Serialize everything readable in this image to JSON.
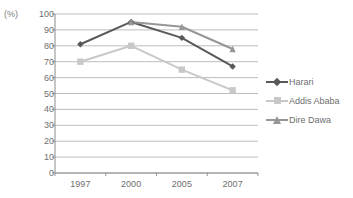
{
  "chart_data": {
    "type": "line",
    "title": "",
    "xlabel": "",
    "ylabel": "(%)",
    "categories": [
      "1997",
      "2000",
      "2005",
      "2007"
    ],
    "ylim": [
      0,
      100
    ],
    "ytick_step": 10,
    "yticks": [
      100,
      90,
      80,
      70,
      60,
      50,
      40,
      30,
      20,
      10,
      0
    ],
    "grid": "horizontal",
    "legend_position": "right",
    "series": [
      {
        "name": "Harari",
        "values": [
          81,
          95,
          85,
          67
        ],
        "color": "#595959",
        "marker": "diamond"
      },
      {
        "name": "Addis Ababa",
        "values": [
          70,
          80,
          65,
          52
        ],
        "color": "#c8c8c8",
        "marker": "square"
      },
      {
        "name": "Dire Dawa",
        "values": [
          null,
          95,
          92,
          78
        ],
        "color": "#969696",
        "marker": "triangle"
      }
    ]
  },
  "axis": {
    "unit_label": "(%)",
    "y_tick_labels": [
      "100",
      "90",
      "80",
      "70",
      "60",
      "50",
      "40",
      "30",
      "20",
      "10",
      "0"
    ],
    "x_tick_labels": [
      "1997",
      "2000",
      "2005",
      "2007"
    ]
  },
  "legend": {
    "items": [
      {
        "label": "Harari"
      },
      {
        "label": "Addis Ababa"
      },
      {
        "label": "Dire Dawa"
      }
    ]
  },
  "colors": {
    "harari": "#595959",
    "addis_ababa": "#c8c8c8",
    "dire_dawa": "#969696",
    "gridline": "#b5b5b5",
    "axis": "#8a8a8a",
    "text": "#6e6e6e",
    "background": "#ffffff"
  }
}
